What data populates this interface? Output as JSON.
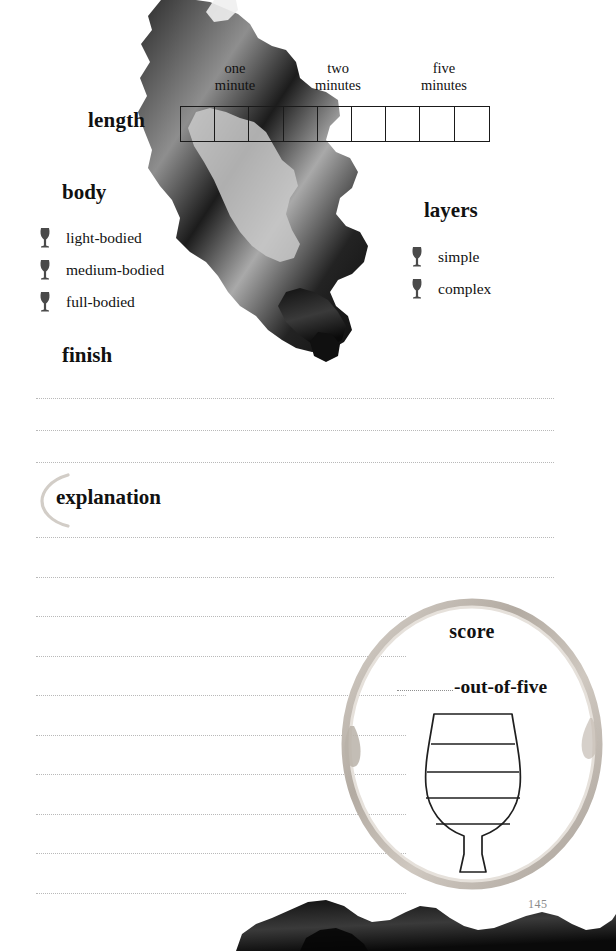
{
  "page": {
    "number": "145",
    "background_color": "#ffffff",
    "ink_color": "#111111",
    "rule_color": "#b9b9b9"
  },
  "length_section": {
    "label": "length",
    "scale_box_count": 9,
    "ticks": [
      {
        "line1": "one",
        "line2": "minute",
        "box_index": 1
      },
      {
        "line1": "two",
        "line2": "minutes",
        "box_index": 4
      },
      {
        "line1": "five",
        "line2": "minutes",
        "box_index": 7
      }
    ]
  },
  "body_section": {
    "heading": "body",
    "options": [
      {
        "icon": "wine-glass-icon",
        "label": "light-bodied"
      },
      {
        "icon": "wine-glass-icon",
        "label": "medium-bodied"
      },
      {
        "icon": "wine-glass-icon",
        "label": "full-bodied"
      }
    ]
  },
  "layers_section": {
    "heading": "layers",
    "options": [
      {
        "icon": "wine-glass-icon",
        "label": "simple"
      },
      {
        "icon": "wine-glass-icon",
        "label": "complex"
      }
    ]
  },
  "finish_section": {
    "heading": "finish",
    "line_count": 3
  },
  "explanation_section": {
    "heading": "explanation",
    "line_count": 10
  },
  "score_section": {
    "heading": "score",
    "blank_placeholder": "",
    "suffix": "-out-of-five",
    "glass_level_count": 5,
    "glass_divider_count": 4,
    "ring_color": "#c9c3bd"
  }
}
